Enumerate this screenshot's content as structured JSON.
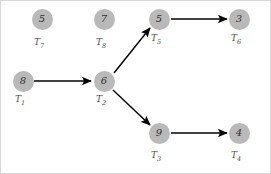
{
  "diagram": {
    "type": "directed-graph",
    "background_color": "#ffffff",
    "node_fill_color": "#b9b9b9",
    "node_text_color": "#2e2e2e",
    "label_text_color": "#4a4a4a",
    "edge_color": "#000000",
    "nodes": [
      {
        "id": "T1",
        "value": "8",
        "label": "T",
        "subscript": "1",
        "cx": 22,
        "cy": 80,
        "label_x": 14,
        "label_y": 94
      },
      {
        "id": "T2",
        "value": "6",
        "label": "T",
        "subscript": "2",
        "cx": 103,
        "cy": 80,
        "label_x": 95,
        "label_y": 94
      },
      {
        "id": "T3",
        "value": "9",
        "label": "T",
        "subscript": "3",
        "cx": 158,
        "cy": 132,
        "label_x": 150,
        "label_y": 150
      },
      {
        "id": "T4",
        "value": "4",
        "label": "T",
        "subscript": "4",
        "cx": 238,
        "cy": 132,
        "label_x": 230,
        "label_y": 150
      },
      {
        "id": "T5",
        "value": "5",
        "label": "T",
        "subscript": "5",
        "cx": 158,
        "cy": 18,
        "label_x": 150,
        "label_y": 33
      },
      {
        "id": "T6",
        "value": "3",
        "label": "T",
        "subscript": "6",
        "cx": 238,
        "cy": 18,
        "label_x": 230,
        "label_y": 33
      },
      {
        "id": "T7",
        "value": "5",
        "label": "T",
        "subscript": "7",
        "cx": 41,
        "cy": 18,
        "label_x": 33,
        "label_y": 37
      },
      {
        "id": "T8",
        "value": "7",
        "label": "T",
        "subscript": "8",
        "cx": 103,
        "cy": 18,
        "label_x": 95,
        "label_y": 37
      }
    ],
    "edges": [
      {
        "from": "T1",
        "to": "T2",
        "x1": 33,
        "y1": 80,
        "x2": 90,
        "y2": 80
      },
      {
        "from": "T2",
        "to": "T5",
        "x1": 113,
        "y1": 72,
        "x2": 149,
        "y2": 27
      },
      {
        "from": "T2",
        "to": "T3",
        "x1": 112,
        "y1": 89,
        "x2": 149,
        "y2": 124
      },
      {
        "from": "T5",
        "to": "T6",
        "x1": 170,
        "y1": 18,
        "x2": 226,
        "y2": 18
      },
      {
        "from": "T3",
        "to": "T4",
        "x1": 170,
        "y1": 132,
        "x2": 226,
        "y2": 132
      }
    ]
  }
}
